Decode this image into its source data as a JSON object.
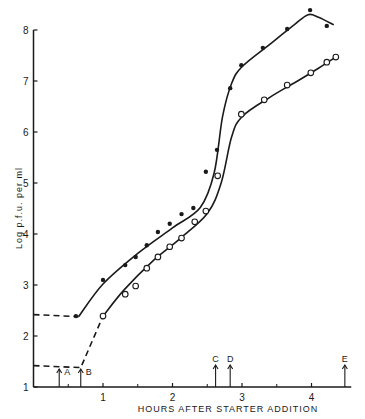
{
  "chart_data": {
    "type": "line",
    "title": "",
    "xlabel": "HOURS AFTER STARTER ADDITION",
    "ylabel": "Log p.f.u. per ml",
    "xlim": [
      0,
      4.5
    ],
    "ylim": [
      1,
      8
    ],
    "x_ticks": [
      1,
      2,
      3,
      4
    ],
    "x_minor_ticks": [
      0.5,
      1.5,
      2.5,
      3.5
    ],
    "y_ticks": [
      1,
      2,
      3,
      4,
      5,
      6,
      7,
      8
    ],
    "grid": false,
    "legend": null,
    "series": [
      {
        "name": "filled circles",
        "marker": "filled-circle",
        "x": [
          0.61,
          1.0,
          1.32,
          1.47,
          1.63,
          1.79,
          1.96,
          2.13,
          2.3,
          2.48,
          2.64,
          2.83,
          2.99,
          3.3,
          3.65,
          3.98,
          4.22
        ],
        "y": [
          2.39,
          3.1,
          3.39,
          3.55,
          3.78,
          4.04,
          4.2,
          4.39,
          4.51,
          5.22,
          5.65,
          6.86,
          7.31,
          7.65,
          8.02,
          8.39,
          8.08
        ],
        "baseline_dashed": {
          "x": [
            0,
            0.65
          ],
          "y": [
            2.42,
            2.38
          ]
        }
      },
      {
        "name": "open circles",
        "marker": "open-circle",
        "x": [
          1.0,
          1.32,
          1.47,
          1.63,
          1.79,
          1.96,
          2.13,
          2.32,
          2.48,
          2.65,
          2.99,
          3.32,
          3.65,
          3.99,
          4.22,
          4.35
        ],
        "y": [
          2.39,
          2.82,
          2.98,
          3.33,
          3.55,
          3.75,
          3.92,
          4.24,
          4.45,
          5.14,
          6.35,
          6.63,
          6.92,
          7.16,
          7.37,
          7.47
        ],
        "baseline_dashed": {
          "x": [
            0,
            0.68,
            1.0
          ],
          "y": [
            1.42,
            1.38,
            2.39
          ]
        }
      }
    ],
    "annotations": [
      {
        "label": "A",
        "x": 0.37,
        "type": "arrow-up"
      },
      {
        "label": "B",
        "x": 0.68,
        "type": "arrow-up"
      },
      {
        "label": "C",
        "x": 2.62,
        "type": "arrow-up"
      },
      {
        "label": "D",
        "x": 2.83,
        "type": "arrow-up"
      },
      {
        "label": "E",
        "x": 4.48,
        "type": "arrow-up"
      }
    ]
  },
  "labels": {
    "xlabel": "HOURS AFTER STARTER ADDITION",
    "ylabel": "Log   p.f.u.   per   ml"
  }
}
